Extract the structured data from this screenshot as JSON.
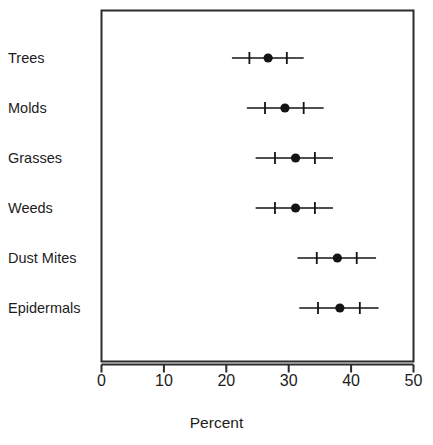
{
  "figure": {
    "top_sliver_text": "....  ... ... ...  ....... ..... .. .... ... ..... ....",
    "background_color": "#ffffff",
    "frame_color": "#2b2b2b",
    "mark_color": "#141414"
  },
  "chart_data": {
    "type": "scatter",
    "title": "",
    "subtitle": "",
    "xlabel": "Percent",
    "ylabel": "",
    "orientation": "horizontal",
    "grid": false,
    "legend": null,
    "xlim": [
      0,
      50
    ],
    "xticks": [
      0,
      10,
      20,
      30,
      40,
      50
    ],
    "xtick_labels": [
      "0",
      "10",
      "20",
      "30",
      "40",
      "50"
    ],
    "categories": [
      "Trees",
      "Molds",
      "Grasses",
      "Weeds",
      "Dust Mites",
      "Epidermals"
    ],
    "value_label": "Percent",
    "marker": "filled-circle",
    "error_bar_style": "outer-range-with-inner-ticks",
    "series": [
      {
        "name": "Percent",
        "values": [
          26.7,
          29.4,
          31.1,
          31.1,
          37.8,
          38.2
        ]
      }
    ],
    "points": [
      {
        "category": "Trees",
        "value": 26.7,
        "inner_low": 23.7,
        "inner_high": 29.7,
        "outer_low": 20.9,
        "outer_high": 32.4
      },
      {
        "category": "Molds",
        "value": 29.4,
        "inner_low": 26.2,
        "inner_high": 32.4,
        "outer_low": 23.3,
        "outer_high": 35.6
      },
      {
        "category": "Grasses",
        "value": 31.1,
        "inner_low": 27.8,
        "inner_high": 34.2,
        "outer_low": 24.7,
        "outer_high": 37.1
      },
      {
        "category": "Weeds",
        "value": 31.1,
        "inner_low": 27.8,
        "inner_high": 34.2,
        "outer_low": 24.7,
        "outer_high": 37.1
      },
      {
        "category": "Dust Mites",
        "value": 37.8,
        "inner_low": 34.5,
        "inner_high": 40.9,
        "outer_low": 31.4,
        "outer_high": 44.0
      },
      {
        "category": "Epidermals",
        "value": 38.2,
        "inner_low": 34.7,
        "inner_high": 41.4,
        "outer_low": 31.7,
        "outer_high": 44.4
      }
    ]
  }
}
